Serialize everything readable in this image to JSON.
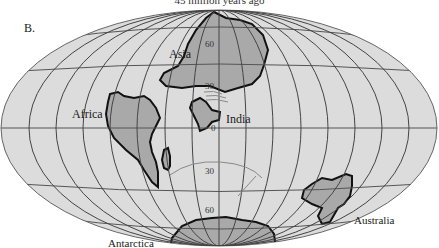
{
  "caption": "45 million years ago",
  "panel_label": "B.",
  "map": {
    "projection": "elliptical equal-area world map",
    "colors": {
      "ocean": "#dcdcdc",
      "landmass": "#a9a9a9",
      "coastline": "#1a1a1a",
      "graticule": "#555555"
    },
    "latitude_labels": [
      "60",
      "30",
      "0",
      "30",
      "60"
    ],
    "continents": [
      {
        "id": "asia",
        "label": "Asia"
      },
      {
        "id": "africa",
        "label": "Africa"
      },
      {
        "id": "india",
        "label": "India"
      },
      {
        "id": "australia",
        "label": "Australia"
      },
      {
        "id": "antarctica",
        "label": "Antarctica"
      }
    ]
  }
}
